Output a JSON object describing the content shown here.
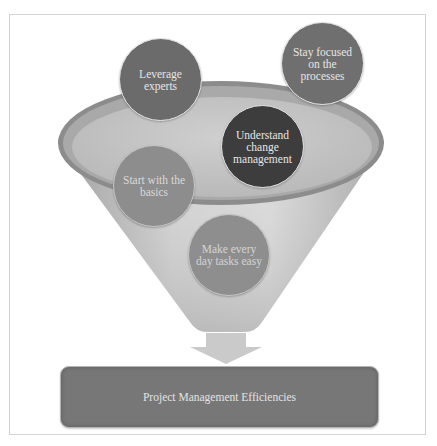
{
  "diagram": {
    "type": "funnel",
    "inputs": [
      {
        "id": "leverage",
        "label": "Leverage experts",
        "color": "#6b6b6b"
      },
      {
        "id": "stay",
        "label": "Stay focused on the processes",
        "color": "#6f6f6f"
      },
      {
        "id": "understand",
        "label": "Understand change management",
        "color": "#3d3d3d"
      },
      {
        "id": "start",
        "label": "Start with the basics",
        "color": "#8d8d8d"
      },
      {
        "id": "make",
        "label": "Make every day tasks easy",
        "color": "#8e8e8e"
      }
    ],
    "output": {
      "label": "Project Management Efficiencies",
      "color": "#777777"
    },
    "arrow": {
      "direction": "down",
      "color": "#c9c9c9"
    }
  }
}
